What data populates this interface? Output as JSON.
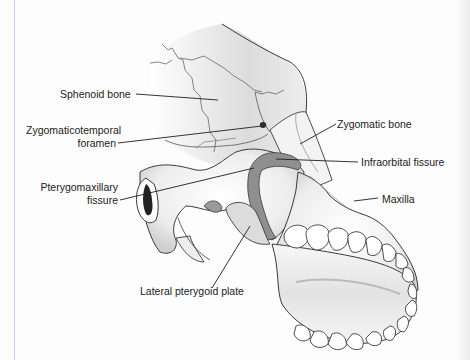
{
  "figure": {
    "labels": [
      {
        "id": "sphenoid",
        "text": "Sphenoid bone"
      },
      {
        "id": "zygomaticotemporal_1",
        "text": "Zygomaticotemporal"
      },
      {
        "id": "zygomaticotemporal_2",
        "text": "foramen"
      },
      {
        "id": "zygomatic",
        "text": "Zygomatic bone"
      },
      {
        "id": "infraorbital",
        "text": "Infraorbital fissure"
      },
      {
        "id": "pterygomaxillary_1",
        "text": "Pterygomaxillary"
      },
      {
        "id": "pterygomaxillary_2",
        "text": "fissure"
      },
      {
        "id": "maxilla",
        "text": "Maxilla"
      },
      {
        "id": "lateral_pterygoid",
        "text": "Lateral pterygoid plate"
      }
    ]
  },
  "colors": {
    "outline": "#3a3a3a",
    "bone_light": "#f2f2f2",
    "bone_mid": "#d6d6d6",
    "bone_dark": "#9a9a9a",
    "fissure": "#8c8c8c",
    "margin_rule": "#c9cce8"
  }
}
